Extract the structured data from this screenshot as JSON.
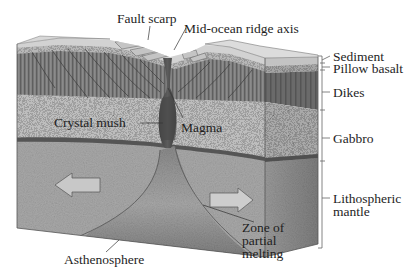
{
  "diagram": {
    "labels": {
      "fault_scarp": "Fault scarp",
      "ridge_axis": "Mid-ocean ridge axis",
      "sediment": "Sediment",
      "pillow_basalt": "Pillow basalt",
      "dikes": "Dikes",
      "gabbro": "Gabbro",
      "lithospheric_mantle_1": "Lithospheric",
      "lithospheric_mantle_2": "mantle",
      "crystal_mush": "Crystal mush",
      "magma": "Magma",
      "zone_1": "Zone of",
      "zone_2": "partial",
      "zone_3": "melting",
      "asthenosphere": "Asthenosphere"
    },
    "layers": [
      {
        "name": "Sediment",
        "color": "#c9c9c9"
      },
      {
        "name": "Pillow basalt",
        "color": "#b2b2b2"
      },
      {
        "name": "Dikes",
        "color": "#7d7d7d"
      },
      {
        "name": "Gabbro",
        "color": "#b8b8b8"
      },
      {
        "name": "Lithospheric mantle",
        "color": "#a6a6a6"
      },
      {
        "name": "Asthenosphere",
        "color": "#8e8e8e"
      }
    ],
    "arrows": [
      {
        "name": "plate-motion-left",
        "direction": "left"
      },
      {
        "name": "plate-motion-right",
        "direction": "right"
      }
    ]
  }
}
